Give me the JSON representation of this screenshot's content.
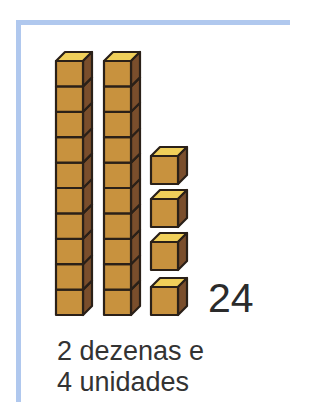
{
  "illustration": {
    "tens_rods": 2,
    "cubes_per_rod": 10,
    "unit_cubes": 4,
    "colors": {
      "front": "#c8923e",
      "side": "#7a4e2c",
      "top": "#f0cf5a",
      "outline": "#2a2018",
      "frame": "#b0c8ee"
    }
  },
  "number": "24",
  "caption": {
    "line1": "2 dezenas e",
    "line2": "4 unidades"
  }
}
